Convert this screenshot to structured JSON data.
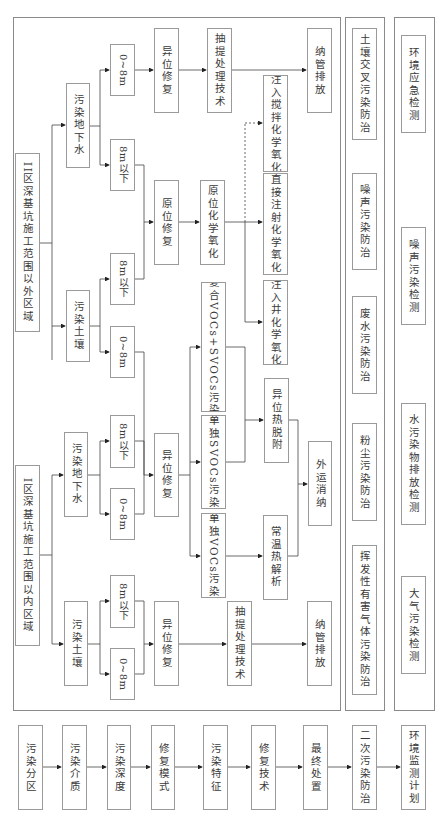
{
  "steps": [
    {
      "id": "s1",
      "label": "污染分区"
    },
    {
      "id": "s2",
      "label": "污染介质"
    },
    {
      "id": "s3",
      "label": "污染深度"
    },
    {
      "id": "s4",
      "label": "修复模式"
    },
    {
      "id": "s5",
      "label": "污染特征"
    },
    {
      "id": "s6",
      "label": "修复技术"
    },
    {
      "id": "s7",
      "label": "最终处置"
    },
    {
      "id": "s8",
      "label": "二次污染防治"
    },
    {
      "id": "s9",
      "label": "环境监测计划"
    }
  ],
  "zone2": {
    "title": "II区深基坑施工范围以外区域",
    "groundwater": "污染地下水",
    "soil": "污染土壤",
    "gw_shallow": "0~8m",
    "gw_deep": "8m以下",
    "soil_deep": "8m以下",
    "soil_shallow": "0~8m",
    "exsitu": "异位修复",
    "pump_treat": "抽提处理技术",
    "discharge": "纳管排放",
    "insitu": "原位修复",
    "isco": "原位化学氧化",
    "mix_inject": "注入搅拌化学氧化",
    "direct_inject": "直接注射化学氧化",
    "well_inject": "注入井化学氧化"
  },
  "middle": {
    "voc_svoc": "复合VOCs+SVOCs污染",
    "svoc_only": "单独SVOCs污染",
    "voc_only": "单独VOCs污染",
    "thermal_desorp": "异位热脱附",
    "ambient_desorp": "常温热解析",
    "offsite": "外运消纳"
  },
  "zone1": {
    "title": "I区深基坑施工范围以内区域",
    "groundwater": "污染地下水",
    "soil": "污染土壤",
    "gw_deep": "8m以下",
    "gw_shallow": "0~8m",
    "soil_deep": "8m以下",
    "soil_shallow": "0~8m",
    "gw_exsitu": "异位修复",
    "soil_exsitu": "异位修复",
    "pump_treat": "抽提处理技术",
    "discharge": "纳管排放"
  },
  "secondary_pollution": [
    "土壤交叉污染防治",
    "噪声污染防治",
    "废水污染防治",
    "粉尘污染防治",
    "挥发性有害气体污染防治"
  ],
  "monitoring": [
    "环境应急检测",
    "噪声污染检测",
    "水污染物排放检测",
    "大气污染检测"
  ]
}
